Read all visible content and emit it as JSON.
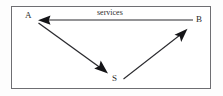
{
  "figure": {
    "type": "node-arrow-diagram",
    "background_color": "#ffffff",
    "frame_border_color": "#6e6e72",
    "stroke_color": "#1a1a1a"
  },
  "nodes": [
    {
      "id": "A",
      "label": "A",
      "x": 38,
      "y": 20
    },
    {
      "id": "B",
      "label": "B",
      "x": 193,
      "y": 21
    },
    {
      "id": "S",
      "label": "S",
      "x": 115,
      "y": 76
    }
  ],
  "edges": [
    {
      "id": "b-to-a",
      "from": "B",
      "to": "A",
      "label": "services",
      "direction": "left",
      "x1": 193,
      "y1": 20,
      "x2": 39,
      "y2": 20
    },
    {
      "id": "a-to-s",
      "from": "A",
      "to": "S",
      "label": "",
      "direction": "down-right",
      "x1": 38,
      "y1": 23,
      "x2": 107,
      "y2": 73
    },
    {
      "id": "s-to-b",
      "from": "S",
      "to": "B",
      "label": "",
      "direction": "up-right",
      "x1": 123,
      "y1": 79,
      "x2": 187,
      "y2": 29
    }
  ],
  "labels": {
    "node_a": "A",
    "node_b": "B",
    "node_s": "S",
    "edge_services": "services"
  }
}
